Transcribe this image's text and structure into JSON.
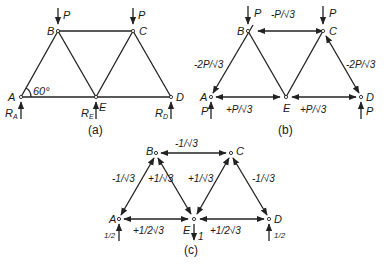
{
  "figure": {
    "panels": [
      {
        "id": "a",
        "caption": "(a)",
        "nodes": {
          "A": "A",
          "B": "B",
          "C": "C",
          "D": "D",
          "E": "E"
        },
        "angle_label": "60°",
        "loads": {
          "B": "P",
          "C": "P"
        },
        "reactions": {
          "A": "R",
          "A_sub": "A",
          "E": "R",
          "E_sub": "E",
          "D": "R",
          "D_sub": "D"
        }
      },
      {
        "id": "b",
        "caption": "(b)",
        "nodes": {
          "A": "A",
          "B": "B",
          "C": "C",
          "D": "D",
          "E": "E"
        },
        "loads": {
          "B": "P",
          "C": "P"
        },
        "reactions": {
          "A": "P",
          "D": "P"
        },
        "member_forces": {
          "BC": "-P/√3",
          "AB": "-2P/√3",
          "CD": "-2P/√3",
          "AE": "+P/√3",
          "ED": "+P/√3"
        }
      },
      {
        "id": "c",
        "caption": "(c)",
        "nodes": {
          "A": "A",
          "B": "B",
          "C": "C",
          "D": "D",
          "E": "E"
        },
        "loads": {
          "E": "1"
        },
        "reactions": {
          "A": "1/2",
          "D": "1/2"
        },
        "member_forces": {
          "BC": "-1/√3",
          "AB": "-1/√3",
          "BE": "+1/√3",
          "CE": "+1/√3",
          "CD": "-1/√3",
          "AE": "+1/2√3",
          "ED": "+1/2√3"
        }
      }
    ]
  }
}
